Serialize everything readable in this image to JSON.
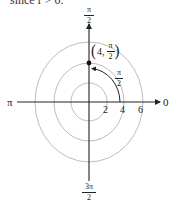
{
  "caption": "since r > 0.",
  "diagram": {
    "type": "polar-coordinate-plot",
    "center": {
      "x": 89,
      "y": 102
    },
    "colors": {
      "axis": "#222222",
      "grid": "#b8b8b8",
      "point": "#111111"
    },
    "angle_labels": {
      "top": {
        "num": "π",
        "den": "2"
      },
      "left": "π",
      "right": "0",
      "bottom": {
        "num": "3π",
        "den": "2"
      }
    },
    "radial_ticks": [
      "2",
      "4",
      "6"
    ],
    "point": {
      "r": "4",
      "theta_num": "π",
      "theta_den": "2",
      "coords_prefix": "4,"
    },
    "angle_marker": {
      "num": "π",
      "den": "2"
    }
  }
}
